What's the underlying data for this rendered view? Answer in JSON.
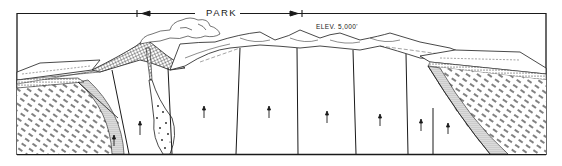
{
  "diagram": {
    "type": "geologic-cross-section",
    "labels": {
      "park": "PARK",
      "elevation": "ELEV. 5,000'"
    },
    "park_extent_arrow": {
      "left_marker_x": 137,
      "right_marker_x": 302,
      "left_arrow_direction": "left",
      "right_arrow_direction": "right"
    },
    "features": [
      "steam-plume",
      "volcanic-cone",
      "volcanic-conduit",
      "breccia-pipe",
      "hummocky-plateau-surface",
      "left-folded-strata",
      "right-tilted-strata",
      "normal-faults",
      "uplift-arrows"
    ],
    "uplift_arrows_count": 9,
    "fault_count": 8,
    "colors": {
      "ink": "#1a1a1a",
      "paper": "#ffffff"
    }
  }
}
